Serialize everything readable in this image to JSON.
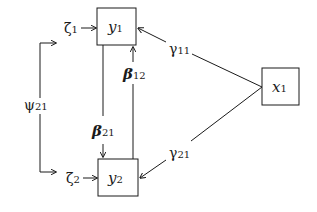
{
  "diagram": {
    "title": "",
    "nodes": {
      "y1": {
        "label": "y",
        "sub": "1"
      },
      "y2": {
        "label": "y",
        "sub": "2"
      },
      "x1": {
        "label": "x",
        "sub": "1"
      }
    },
    "disturbances": {
      "zeta1": {
        "label": "ζ",
        "sub": "1"
      },
      "zeta2": {
        "label": "ζ",
        "sub": "2"
      }
    },
    "paths": {
      "gamma11": {
        "label": "γ",
        "sub": "11",
        "from": "x1",
        "to": "y1"
      },
      "gamma21": {
        "label": "γ",
        "sub": "21",
        "from": "x1",
        "to": "y2"
      },
      "beta21": {
        "label": "β",
        "sub": "21",
        "from": "y1",
        "to": "y2"
      },
      "beta12": {
        "label": "β",
        "sub": "12",
        "from": "y2",
        "to": "y1"
      }
    },
    "covariances": {
      "psi21": {
        "label": "ψ",
        "sub": "21",
        "between": [
          "zeta1",
          "zeta2"
        ]
      }
    },
    "colors": {
      "stroke": "#1a1a1a",
      "background": "#ffffff"
    }
  }
}
